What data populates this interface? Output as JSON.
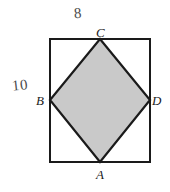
{
  "figure": {
    "background_color": "#ffffff",
    "stroke_color": "#1a1a1a",
    "fill_color": "#c9c9c9",
    "rectangle": {
      "x": 50,
      "y": 39,
      "width": 100,
      "height": 123,
      "stroke_width": 2.2,
      "fill": "#ffffff"
    },
    "rhombus": {
      "fill": "#c9c9c9",
      "stroke_width": 2.2,
      "points": "100,39 150,100 100,162 50,100"
    }
  },
  "vertex_labels": {
    "top": "C",
    "left": "B",
    "right": "D",
    "bottom": "A"
  },
  "measurements": {
    "top_length": "8",
    "left_length": "10"
  }
}
